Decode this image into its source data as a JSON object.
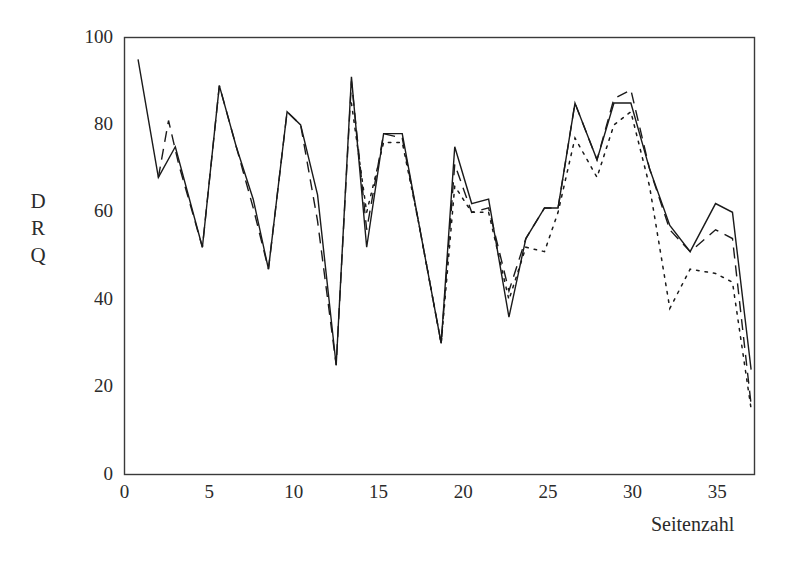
{
  "chart_data": {
    "type": "line",
    "title": "",
    "xlabel": "Seitenzahl",
    "ylabel": "DRQ",
    "ylabel_stacked": [
      "D",
      "R",
      "Q"
    ],
    "xlim": [
      0,
      37.2
    ],
    "ylim": [
      0,
      100
    ],
    "grid": false,
    "legend": "none",
    "xticks": [
      0,
      5,
      10,
      15,
      20,
      25,
      30,
      35
    ],
    "xtick_labels": [
      "0",
      "5",
      "10",
      "15",
      "20",
      "25",
      "30",
      "35"
    ],
    "yticks": [
      0,
      20,
      40,
      60,
      80,
      100
    ],
    "ytick_labels": [
      "0",
      "20",
      "40",
      "60",
      "80",
      "100"
    ],
    "series": [
      {
        "name": "series-solid",
        "style": "solid",
        "color": "#1a1a1a",
        "x": [
          0.8,
          2.0,
          3.0,
          4.6,
          5.6,
          6.6,
          7.6,
          8.5,
          9.6,
          10.4,
          11.4,
          12.5,
          13.4,
          14.3,
          15.3,
          16.4,
          17.4,
          18.7,
          19.5,
          20.5,
          21.5,
          22.7,
          23.7,
          24.8,
          25.6,
          26.6,
          27.9,
          28.9,
          29.9,
          31.0,
          32.2,
          33.4,
          34.9,
          35.9,
          37.0
        ],
        "y": [
          95,
          68,
          75,
          52,
          89,
          75,
          63,
          47,
          83,
          80,
          64,
          25,
          91,
          52,
          78,
          78,
          57,
          30,
          75,
          62,
          63,
          36,
          54,
          61,
          61,
          85,
          72,
          85,
          85,
          70,
          57,
          51,
          62,
          60,
          24
        ]
      },
      {
        "name": "series-dashed",
        "style": "dashed",
        "color": "#1a1a1a",
        "x": [
          2.0,
          2.6,
          3.2,
          4.6,
          5.6,
          6.6,
          7.6,
          8.5,
          9.6,
          10.4,
          11.4,
          12.5,
          13.4,
          14.3,
          15.3,
          16.4,
          17.4,
          18.7,
          19.5,
          20.5,
          21.5,
          22.7,
          23.7,
          24.8,
          25.6,
          26.6,
          27.9,
          28.9,
          29.9,
          31.0,
          32.2,
          33.4,
          34.9,
          35.9,
          37.0
        ],
        "y": [
          68,
          81,
          71,
          52,
          89,
          75,
          61,
          47,
          83,
          80,
          58,
          25,
          90,
          56,
          78,
          77,
          57,
          30,
          71,
          60,
          61,
          42,
          54,
          61,
          61,
          85,
          72,
          86,
          88,
          70,
          56,
          51,
          56,
          54,
          16
        ]
      },
      {
        "name": "series-dotted",
        "style": "dotted",
        "color": "#1a1a1a",
        "x": [
          13.4,
          14.3,
          15.3,
          16.4,
          17.4,
          18.7,
          19.5,
          20.5,
          21.5,
          22.7,
          23.7,
          24.8,
          25.6,
          26.6,
          27.9,
          28.9,
          29.9,
          31.0,
          32.2,
          33.4,
          34.9,
          35.9,
          37.0
        ],
        "y": [
          85,
          60,
          76,
          76,
          57,
          30,
          66,
          60,
          60,
          40,
          52,
          51,
          60,
          77,
          68,
          80,
          83,
          66,
          38,
          47,
          46,
          44,
          15
        ]
      }
    ]
  }
}
